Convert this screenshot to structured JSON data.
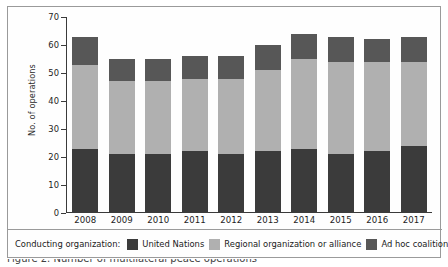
{
  "chart_data": {
    "type": "bar",
    "stacked": true,
    "title": "",
    "xlabel": "",
    "ylabel": "No. of operations",
    "ylim": [
      0,
      70
    ],
    "yticks": [
      0,
      10,
      20,
      30,
      40,
      50,
      60,
      70
    ],
    "grid": false,
    "legend_position": "bottom",
    "legend_title": "Conducting organization:",
    "categories": [
      "2008",
      "2009",
      "2010",
      "2011",
      "2012",
      "2013",
      "2014",
      "2015",
      "2016",
      "2017"
    ],
    "series": [
      {
        "name": "United Nations",
        "color": "#3b3b3b",
        "values": [
          23,
          21,
          21,
          22,
          21,
          22,
          23,
          21,
          22,
          24
        ]
      },
      {
        "name": "Regional organization or alliance",
        "color": "#b0b0b0",
        "values": [
          30,
          26,
          26,
          26,
          27,
          29,
          32,
          33,
          32,
          30
        ]
      },
      {
        "name": "Ad hoc coalition",
        "color": "#575757",
        "values": [
          10,
          8,
          8,
          8,
          8,
          9,
          9,
          9,
          8,
          9
        ]
      }
    ],
    "totals": [
      63,
      55,
      55,
      56,
      56,
      60,
      64,
      63,
      62,
      63
    ]
  },
  "figure": {
    "caption_partial": "Figure 2. Number of multilateral peace operations"
  },
  "axis": {
    "y_label": "No. of operations",
    "y_ticks": [
      "70",
      "60",
      "50",
      "40",
      "30",
      "20",
      "10",
      "0"
    ],
    "x_ticks": [
      "2008",
      "2009",
      "2010",
      "2011",
      "2012",
      "2013",
      "2014",
      "2015",
      "2016",
      "2017"
    ]
  },
  "legend": {
    "title": "Conducting organization:",
    "items": [
      {
        "label": "United Nations",
        "color": "#3b3b3b"
      },
      {
        "label": "Regional organization or alliance",
        "color": "#b0b0b0"
      },
      {
        "label": "Ad hoc coalition",
        "color": "#575757"
      }
    ]
  },
  "colors": {
    "united_nations": "#3b3b3b",
    "regional": "#b0b0b0",
    "ad_hoc": "#575757",
    "frame": "#9a9a9a",
    "axis": "#3a3a3a"
  }
}
